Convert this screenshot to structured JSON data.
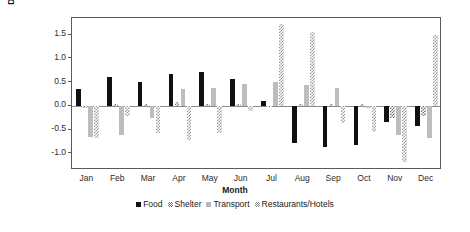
{
  "chart_data": {
    "type": "bar",
    "title": "",
    "xlabel": "Month",
    "ylabel": "Deviation from mean (%)",
    "categories": [
      "Jan",
      "Feb",
      "Mar",
      "Apr",
      "May",
      "Jun",
      "Jul",
      "Aug",
      "Sep",
      "Oct",
      "Nov",
      "Dec"
    ],
    "ylim": [
      -1.35,
      1.85
    ],
    "yticks": [
      1.5,
      1.0,
      0.5,
      0.0,
      -0.5,
      -1.0
    ],
    "ytick_labels": [
      "1.5",
      "1.0",
      "0.5",
      "0.0",
      "-0.5",
      "-1.0"
    ],
    "grid": false,
    "legend_position": "bottom-center",
    "series": [
      {
        "name": "Food",
        "color": "#111111",
        "pattern": "solid",
        "values": [
          0.36,
          0.6,
          0.5,
          0.67,
          0.71,
          0.57,
          0.1,
          -0.78,
          -0.86,
          -0.82,
          -0.33,
          -0.42
        ]
      },
      {
        "name": "Shelter",
        "color": "#6d6d6d",
        "pattern": "hatch",
        "values": [
          -0.05,
          0.04,
          0.03,
          0.09,
          0.04,
          0.05,
          -0.02,
          0.03,
          0.05,
          0.04,
          -0.25,
          -0.22
        ]
      },
      {
        "name": "Transport",
        "color": "#bdbdbd",
        "pattern": "solid",
        "values": [
          -0.65,
          -0.62,
          -0.25,
          0.35,
          0.37,
          0.47,
          0.5,
          0.43,
          0.37,
          -0.05,
          -0.62,
          -0.67
        ]
      },
      {
        "name": "Restaurants/Hotels",
        "color": "#9a9a9a",
        "pattern": "hatch",
        "values": [
          -0.68,
          -0.22,
          -0.58,
          -0.72,
          -0.58,
          -0.1,
          1.73,
          1.55,
          -0.37,
          -0.56,
          -1.18,
          1.5
        ]
      }
    ]
  },
  "axes": {
    "ylabel": "Deviation from mean (%)",
    "xlabel": "Month"
  },
  "legend": {
    "items": [
      {
        "label": "Food"
      },
      {
        "label": "Shelter"
      },
      {
        "label": "Transport"
      },
      {
        "label": "Restaurants/Hotels"
      }
    ]
  }
}
